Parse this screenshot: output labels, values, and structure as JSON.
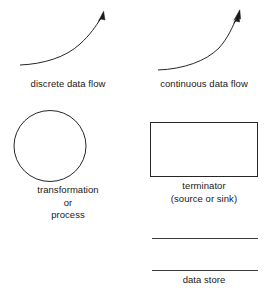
{
  "diagram": {
    "background_color": "#ffffff",
    "stroke_color": "#262626",
    "symbols": [
      {
        "id": "discrete-data-flow",
        "shape": "curved-arrow",
        "arrowhead": "single-open",
        "caption_lines": [
          "discrete data flow"
        ]
      },
      {
        "id": "continuous-data-flow",
        "shape": "curved-arrow",
        "arrowhead": "double-filled",
        "caption_lines": [
          "continuous data flow"
        ]
      },
      {
        "id": "transformation-process",
        "shape": "circle",
        "caption_lines": [
          "transformation",
          "or",
          "process"
        ]
      },
      {
        "id": "terminator",
        "shape": "rectangle",
        "caption_lines": [
          "terminator",
          "(source or sink)"
        ]
      },
      {
        "id": "data-store",
        "shape": "two-parallel-lines",
        "caption_lines": [
          "data store"
        ]
      }
    ]
  }
}
